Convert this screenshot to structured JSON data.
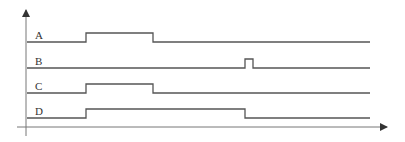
{
  "diagram": {
    "type": "timing-diagram",
    "colors": {
      "line": "#555555",
      "axis": "#777777",
      "text": "#333333"
    },
    "time_range": [
      0,
      100
    ],
    "signals": [
      {
        "name": "A",
        "initial": 0,
        "transitions": [
          {
            "t": 19,
            "level": 1
          },
          {
            "t": 38,
            "level": 0
          }
        ]
      },
      {
        "name": "B",
        "initial": 0,
        "transitions": [
          {
            "t": 62,
            "level": 1
          },
          {
            "t": 64,
            "level": 0
          }
        ]
      },
      {
        "name": "C",
        "initial": 0,
        "transitions": [
          {
            "t": 19,
            "level": 1
          },
          {
            "t": 38,
            "level": 0
          }
        ]
      },
      {
        "name": "D",
        "initial": 0,
        "transitions": [
          {
            "t": 19,
            "level": 1
          },
          {
            "t": 62,
            "level": 0
          }
        ]
      }
    ]
  }
}
